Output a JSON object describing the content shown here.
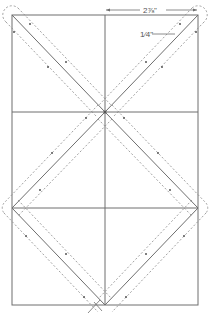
{
  "diagram": {
    "dimensions": {
      "width_label": "2⅞\"",
      "seam_label": "1⁄4\""
    },
    "colors": {
      "line": "#6e6e6e",
      "dashed": "#8a8a8a",
      "background": "#ffffff"
    },
    "grid": {
      "rows": 3,
      "columns": 2
    }
  }
}
